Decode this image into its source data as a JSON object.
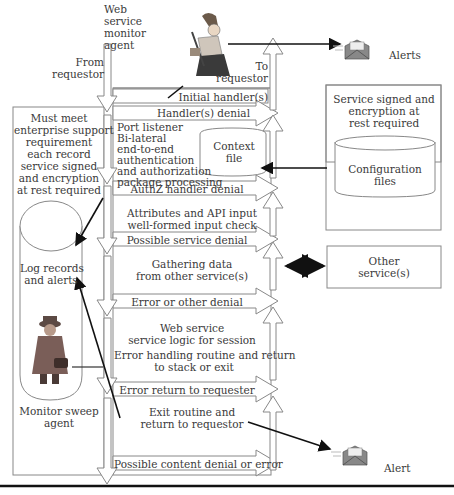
{
  "diagram": {
    "agents": {
      "web_service_monitor": {
        "label": "Web service monitor agent",
        "lines": [
          "Web",
          "service",
          "monitor",
          "agent"
        ],
        "icon": "pirate-agent-icon"
      },
      "monitor_sweep": {
        "label": "Monitor sweep agent",
        "lines": [
          "Monitor sweep",
          "agent"
        ],
        "icon": "spy-agent-icon"
      }
    },
    "flow": {
      "from_requestor": [
        "From",
        "requestor"
      ],
      "to_requestor": [
        "To",
        "requestor"
      ]
    },
    "stages": [
      {
        "id": "initial-handlers",
        "label": "Initial handler(s)"
      },
      {
        "id": "handlers-denial",
        "label": "Handler(s) denial"
      },
      {
        "id": "port-listener",
        "lines": [
          "Port listener",
          "Bi-lateral",
          "end-to-end",
          "authentication",
          "and authorization",
          "package processing"
        ]
      },
      {
        "id": "authz-denial",
        "label": "AuthZ handler denial"
      },
      {
        "id": "attributes-check",
        "lines": [
          "Attributes and API input",
          "well-formed input check"
        ]
      },
      {
        "id": "possible-service-denial",
        "label": "Possible service denial"
      },
      {
        "id": "gathering-data",
        "lines": [
          "Gathering data",
          "from other service(s)"
        ]
      },
      {
        "id": "error-other-denial",
        "label": "Error or other denial"
      },
      {
        "id": "web-service-logic",
        "lines": [
          "Web service",
          "service logic for session"
        ]
      },
      {
        "id": "error-handling",
        "lines": [
          "Error handling routine and return",
          "to stack or exit"
        ]
      },
      {
        "id": "error-return",
        "label": "Error return to requester"
      },
      {
        "id": "exit-routine",
        "lines": [
          "Exit routine and",
          "return to requestor"
        ]
      },
      {
        "id": "content-denial",
        "label": "Possible content denial or error"
      }
    ],
    "context_file": {
      "lines": [
        "Context",
        "file"
      ]
    },
    "left_box": {
      "requirement_lines": [
        "Must meet",
        "enterprise support",
        "requirement",
        "each record",
        "service signed",
        "and encryption",
        "at rest required"
      ],
      "log_store": [
        "Log records",
        "and alerts"
      ]
    },
    "config_box": {
      "title_lines": [
        "Service signed and",
        "encryption at",
        "rest required"
      ],
      "store_lines": [
        "Configuration",
        "files"
      ]
    },
    "other_services": [
      "Other",
      "service(s)"
    ],
    "alerts": {
      "top": "Alerts",
      "bottom": "Alert",
      "icon": "envelope-alert-icon"
    }
  }
}
